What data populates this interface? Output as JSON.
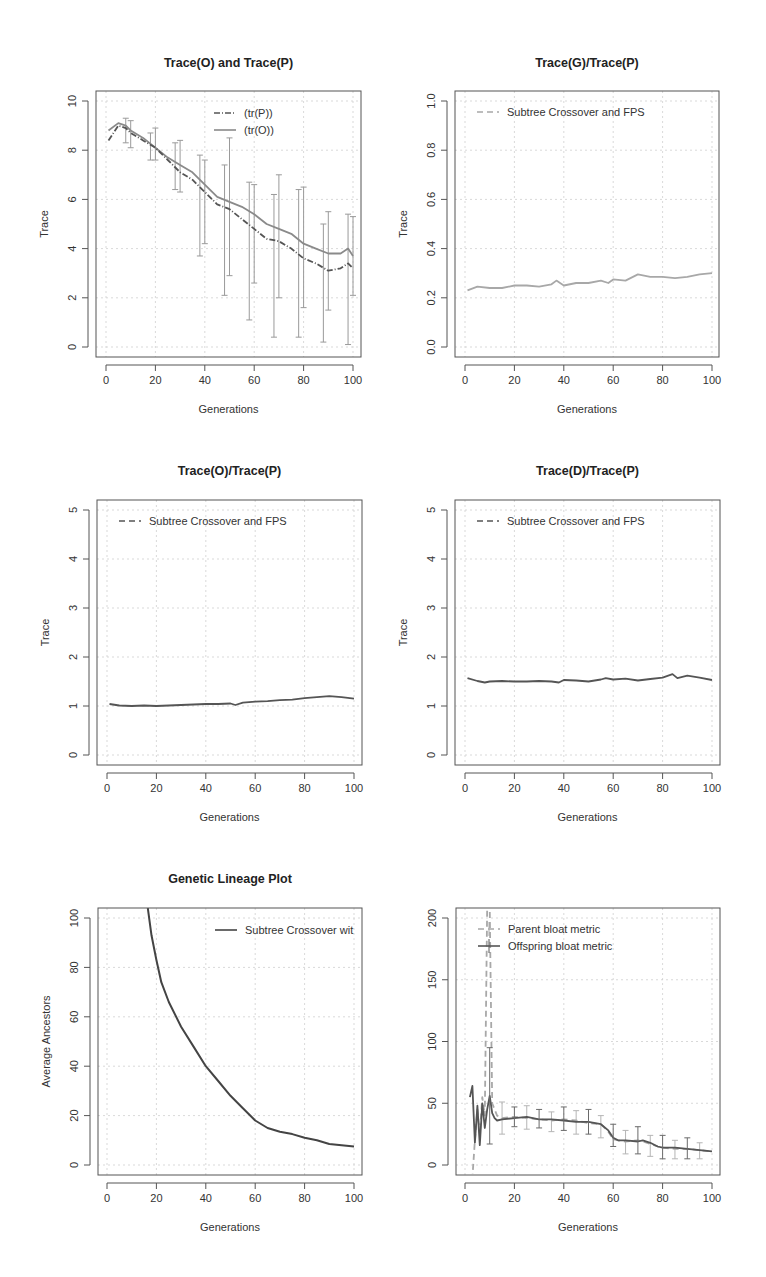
{
  "figure": {
    "caption_partial": "",
    "panels": [
      {
        "id": "trace-o-and-trace-p",
        "title": "Trace(O) and Trace(P)",
        "xlabel": "Generations",
        "ylabel": "Trace"
      },
      {
        "id": "trace-g-over-trace-p",
        "title": "Trace(G)/Trace(P)",
        "xlabel": "Generations",
        "ylabel": "Trace"
      },
      {
        "id": "trace-o-over-trace-p",
        "title": "Trace(O)/Trace(P)",
        "xlabel": "Generations",
        "ylabel": "Trace"
      },
      {
        "id": "trace-d-over-trace-p",
        "title": "Trace(D)/Trace(P)",
        "xlabel": "Generations",
        "ylabel": "Trace"
      },
      {
        "id": "genetic-lineage-plot",
        "title": "Genetic Lineage Plot",
        "xlabel": "Generations",
        "ylabel": "Average Ancestors"
      },
      {
        "id": "bloat-metric",
        "title": "",
        "xlabel": "Generations",
        "ylabel": ""
      }
    ]
  },
  "chart_data": [
    {
      "type": "line",
      "title": "Trace(O) and Trace(P)",
      "xlabel": "Generations",
      "ylabel": "Trace",
      "xlim": [
        0,
        100
      ],
      "ylim": [
        0,
        10
      ],
      "xticks": [
        0,
        20,
        40,
        60,
        80,
        100
      ],
      "yticks": [
        0,
        2,
        4,
        6,
        8,
        10
      ],
      "grid": true,
      "legend": {
        "position": "top-right",
        "entries": [
          "(tr(P))",
          "(tr(O))"
        ]
      },
      "x": [
        1,
        5,
        8,
        10,
        15,
        20,
        25,
        30,
        35,
        40,
        45,
        50,
        55,
        60,
        65,
        70,
        75,
        80,
        85,
        90,
        95,
        98,
        100
      ],
      "series": [
        {
          "name": "(tr(P))",
          "style": "dash-dot",
          "color": "#555555",
          "values": [
            8.4,
            9.0,
            8.9,
            8.7,
            8.4,
            8.1,
            7.6,
            7.1,
            6.8,
            6.3,
            5.8,
            5.6,
            5.2,
            4.8,
            4.4,
            4.3,
            4.0,
            3.6,
            3.4,
            3.1,
            3.2,
            3.4,
            3.2
          ]
        },
        {
          "name": "(tr(O))",
          "style": "solid",
          "color": "#8a8a8a",
          "values": [
            8.8,
            9.1,
            9.0,
            8.8,
            8.5,
            8.1,
            7.7,
            7.4,
            7.1,
            6.6,
            6.1,
            5.9,
            5.7,
            5.4,
            5.0,
            4.8,
            4.6,
            4.2,
            4.0,
            3.8,
            3.8,
            4.0,
            3.7
          ]
        }
      ],
      "error_bars": [
        {
          "x": 8,
          "low": 8.3,
          "high": 9.3
        },
        {
          "x": 10,
          "low": 8.1,
          "high": 9.2
        },
        {
          "x": 18,
          "low": 7.6,
          "high": 8.7
        },
        {
          "x": 20,
          "low": 7.6,
          "high": 8.9
        },
        {
          "x": 28,
          "low": 6.4,
          "high": 8.3
        },
        {
          "x": 30,
          "low": 6.3,
          "high": 8.4
        },
        {
          "x": 38,
          "low": 3.7,
          "high": 7.8
        },
        {
          "x": 40,
          "low": 4.2,
          "high": 7.6
        },
        {
          "x": 48,
          "low": 2.1,
          "high": 7.4
        },
        {
          "x": 50,
          "low": 2.9,
          "high": 8.5
        },
        {
          "x": 58,
          "low": 1.1,
          "high": 6.7
        },
        {
          "x": 60,
          "low": 2.6,
          "high": 6.6
        },
        {
          "x": 68,
          "low": 0.4,
          "high": 6.2
        },
        {
          "x": 70,
          "low": 2.0,
          "high": 7.0
        },
        {
          "x": 78,
          "low": 0.4,
          "high": 6.4
        },
        {
          "x": 80,
          "low": 1.6,
          "high": 6.5
        },
        {
          "x": 88,
          "low": 0.2,
          "high": 5.0
        },
        {
          "x": 90,
          "low": 1.5,
          "high": 5.5
        },
        {
          "x": 98,
          "low": 0.1,
          "high": 5.4
        },
        {
          "x": 100,
          "low": 2.1,
          "high": 5.3
        }
      ]
    },
    {
      "type": "line",
      "title": "Trace(G)/Trace(P)",
      "xlabel": "Generations",
      "ylabel": "Trace",
      "xlim": [
        0,
        100
      ],
      "ylim": [
        0,
        1
      ],
      "xticks": [
        0,
        20,
        40,
        60,
        80,
        100
      ],
      "yticks": [
        0.0,
        0.2,
        0.4,
        0.6,
        0.8,
        1.0
      ],
      "ytick_labels": [
        "0.0",
        "0.2",
        "0.4",
        "0.6",
        "0.8",
        "1.0"
      ],
      "grid": true,
      "legend": {
        "position": "top-left",
        "entries": [
          "Subtree Crossover and FPS"
        ]
      },
      "x": [
        1,
        5,
        10,
        15,
        20,
        25,
        30,
        35,
        37,
        40,
        45,
        50,
        55,
        58,
        60,
        65,
        70,
        75,
        80,
        85,
        90,
        95,
        100
      ],
      "series": [
        {
          "name": "Subtree Crossover and FPS",
          "style": "dashed",
          "color": "#a8a8a8",
          "values": [
            0.23,
            0.245,
            0.24,
            0.24,
            0.25,
            0.25,
            0.245,
            0.255,
            0.27,
            0.25,
            0.26,
            0.26,
            0.27,
            0.26,
            0.275,
            0.27,
            0.295,
            0.285,
            0.285,
            0.28,
            0.285,
            0.295,
            0.3
          ]
        }
      ]
    },
    {
      "type": "line",
      "title": "Trace(O)/Trace(P)",
      "xlabel": "Generations",
      "ylabel": "Trace",
      "xlim": [
        0,
        100
      ],
      "ylim": [
        0,
        5
      ],
      "xticks": [
        0,
        20,
        40,
        60,
        80,
        100
      ],
      "yticks": [
        0,
        1,
        2,
        3,
        4,
        5
      ],
      "grid": true,
      "legend": {
        "position": "top-left",
        "entries": [
          "Subtree Crossover and FPS"
        ]
      },
      "x": [
        1,
        5,
        10,
        15,
        20,
        25,
        30,
        35,
        40,
        45,
        50,
        52,
        55,
        60,
        65,
        70,
        75,
        80,
        85,
        90,
        95,
        100
      ],
      "series": [
        {
          "name": "Subtree Crossover and FPS",
          "style": "dashed",
          "color": "#555555",
          "values": [
            1.04,
            1.01,
            1.0,
            1.01,
            1.0,
            1.01,
            1.02,
            1.03,
            1.04,
            1.04,
            1.05,
            1.02,
            1.07,
            1.09,
            1.1,
            1.12,
            1.13,
            1.16,
            1.18,
            1.2,
            1.18,
            1.15
          ]
        }
      ]
    },
    {
      "type": "line",
      "title": "Trace(D)/Trace(P)",
      "xlabel": "Generations",
      "ylabel": "Trace",
      "xlim": [
        0,
        100
      ],
      "ylim": [
        0,
        5
      ],
      "xticks": [
        0,
        20,
        40,
        60,
        80,
        100
      ],
      "yticks": [
        0,
        1,
        2,
        3,
        4,
        5
      ],
      "grid": true,
      "legend": {
        "position": "top-left",
        "entries": [
          "Subtree Crossover and FPS"
        ]
      },
      "x": [
        1,
        5,
        8,
        10,
        15,
        20,
        25,
        30,
        35,
        38,
        40,
        45,
        50,
        55,
        57,
        60,
        65,
        70,
        75,
        80,
        84,
        86,
        90,
        95,
        100
      ],
      "series": [
        {
          "name": "Subtree Crossover and FPS",
          "style": "dashed",
          "color": "#555555",
          "values": [
            1.57,
            1.51,
            1.48,
            1.5,
            1.51,
            1.5,
            1.5,
            1.51,
            1.5,
            1.48,
            1.53,
            1.52,
            1.5,
            1.54,
            1.57,
            1.54,
            1.56,
            1.52,
            1.55,
            1.58,
            1.65,
            1.57,
            1.62,
            1.58,
            1.53
          ]
        }
      ]
    },
    {
      "type": "line",
      "title": "Genetic Lineage Plot",
      "xlabel": "Generations",
      "ylabel": "Average Ancestors",
      "xlim": [
        0,
        100
      ],
      "ylim": [
        0,
        100
      ],
      "xticks": [
        0,
        20,
        40,
        60,
        80,
        100
      ],
      "yticks": [
        0,
        20,
        40,
        60,
        80,
        100
      ],
      "grid": true,
      "legend": {
        "position": "top-right",
        "entries": [
          "Subtree Crossover wit"
        ]
      },
      "x": [
        16.5,
        18,
        20,
        22,
        25,
        30,
        35,
        40,
        45,
        50,
        55,
        60,
        65,
        70,
        75,
        80,
        85,
        90,
        95,
        100
      ],
      "series": [
        {
          "name": "Subtree Crossover wit",
          "style": "solid",
          "color": "#444444",
          "values": [
            104,
            93,
            83,
            74,
            66,
            56,
            48,
            40,
            34,
            28,
            23,
            18,
            15,
            13.5,
            12.5,
            11,
            10,
            8.5,
            8,
            7.5
          ]
        }
      ]
    },
    {
      "type": "line",
      "title": "",
      "xlabel": "Generations",
      "ylabel": "",
      "xlim": [
        0,
        100
      ],
      "ylim": [
        0,
        200
      ],
      "xticks": [
        0,
        20,
        40,
        60,
        80,
        100
      ],
      "yticks": [
        0,
        50,
        100,
        150,
        200
      ],
      "grid": true,
      "legend": {
        "position": "top-left",
        "entries": [
          "Parent bloat metric",
          "Offspring bloat metric"
        ]
      },
      "x": [
        2,
        3,
        4,
        5,
        6,
        7,
        8,
        9,
        10,
        11,
        12,
        13,
        15,
        20,
        25,
        30,
        35,
        40,
        45,
        50,
        55,
        58,
        60,
        62,
        65,
        70,
        72,
        75,
        78,
        80,
        85,
        90,
        95,
        100
      ],
      "series": [
        {
          "name": "Offspring bloat metric",
          "style": "solid",
          "color": "#555555",
          "values": [
            55,
            64,
            18,
            48,
            16,
            50,
            30,
            45,
            56,
            42,
            38,
            36,
            37,
            38,
            39,
            37,
            37,
            36,
            35,
            35,
            33,
            28,
            22,
            20,
            20,
            19,
            20,
            18,
            15,
            14,
            14,
            13,
            12,
            11
          ]
        },
        {
          "name": "Parent bloat metric",
          "style": "dashed",
          "color": "#a8a8a8",
          "values": [
            -10,
            -10,
            20,
            45,
            25,
            55,
            40,
            210,
            210,
            50,
            45,
            40,
            38,
            39,
            38,
            37,
            36,
            37,
            36,
            34,
            33,
            27,
            21,
            20,
            19,
            20,
            19,
            17,
            15,
            14,
            13,
            13,
            12,
            11
          ]
        }
      ],
      "error_bars_offspring": [
        {
          "x": 10,
          "low": 17,
          "high": 95
        },
        {
          "x": 20,
          "low": 31,
          "high": 47
        },
        {
          "x": 30,
          "low": 30,
          "high": 45
        },
        {
          "x": 40,
          "low": 28,
          "high": 47
        },
        {
          "x": 50,
          "low": 25,
          "high": 45
        },
        {
          "x": 60,
          "low": 15,
          "high": 33
        },
        {
          "x": 70,
          "low": 9,
          "high": 31
        },
        {
          "x": 80,
          "low": 5,
          "high": 24
        },
        {
          "x": 90,
          "low": 5,
          "high": 22
        }
      ],
      "error_bars_parent": [
        {
          "x": 15,
          "low": 25,
          "high": 51
        },
        {
          "x": 25,
          "low": 29,
          "high": 48
        },
        {
          "x": 35,
          "low": 27,
          "high": 43
        },
        {
          "x": 45,
          "low": 25,
          "high": 44
        },
        {
          "x": 55,
          "low": 22,
          "high": 40
        },
        {
          "x": 65,
          "low": 9,
          "high": 28
        },
        {
          "x": 75,
          "low": 7,
          "high": 24
        },
        {
          "x": 85,
          "low": 5,
          "high": 20
        },
        {
          "x": 95,
          "low": 5,
          "high": 18
        }
      ]
    }
  ]
}
